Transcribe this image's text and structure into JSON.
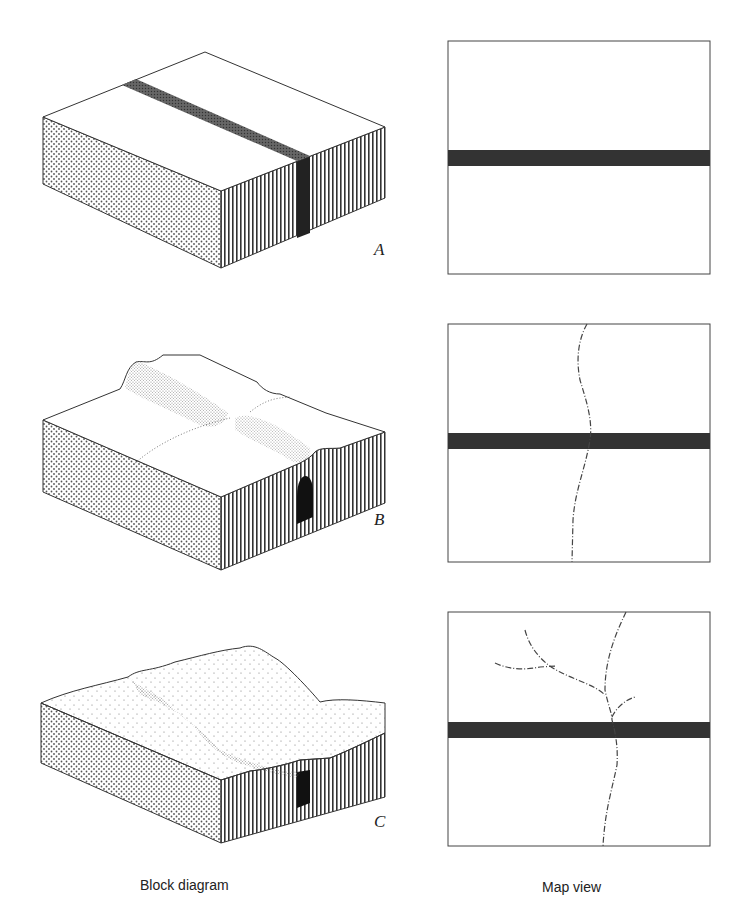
{
  "figure": {
    "columns": {
      "left_caption": "Block diagram",
      "right_caption": "Map view"
    },
    "panels": [
      {
        "letter": "A",
        "block_diagram": {
          "description": "Flat rectangular block with a dark resistant vertical layer exposed as a band across the top surface",
          "top_surface": "flat",
          "left_face_pattern": "dots",
          "right_face_pattern": "vertical-lines"
        },
        "map_view": {
          "band": "horizontal dark band",
          "streams": []
        }
      },
      {
        "letter": "B",
        "block_diagram": {
          "description": "Ridge forming along the resistant layer with a stream valley beginning to cut across it",
          "top_surface": "ridge-and-valley, early stage",
          "left_face_pattern": "dots",
          "right_face_pattern": "vertical-lines"
        },
        "map_view": {
          "band": "horizontal dark band",
          "streams": [
            "single sinuous stream crossing band"
          ]
        }
      },
      {
        "letter": "C",
        "block_diagram": {
          "description": "Mature dissected terrain with water gap through ridge and branching tributaries",
          "top_surface": "rolling hills, dissected",
          "left_face_pattern": "dots",
          "right_face_pattern": "vertical-lines"
        },
        "map_view": {
          "band": "horizontal dark band",
          "streams": [
            "main stream crossing band",
            "tributary branching north-west",
            "tributary branching north-east"
          ]
        }
      }
    ],
    "colors": {
      "ink": "#2a2a2a",
      "band": "#333333",
      "background": "#ffffff"
    }
  }
}
